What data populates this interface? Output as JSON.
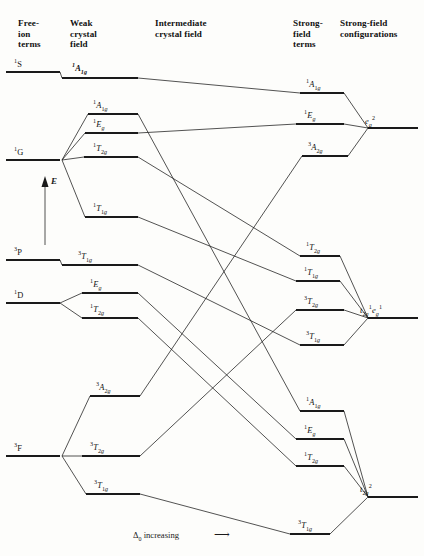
{
  "figure": {
    "title_columns": [
      {
        "id": "free-ion-terms",
        "text": "Free-\nion\nterms",
        "x": 18,
        "y": 18
      },
      {
        "id": "weak-crystal-field",
        "text": "Weak\ncrystal\nfield",
        "x": 70,
        "y": 18
      },
      {
        "id": "intermediate-crystal-field",
        "text": "Intermediate\ncrystal field",
        "x": 155,
        "y": 18
      },
      {
        "id": "strong-field-terms",
        "text": "Strong-\nfield\nterms",
        "x": 293,
        "y": 18
      },
      {
        "id": "strong-field-configurations",
        "text": "Strong-field\nconfigurations",
        "x": 340,
        "y": 18
      }
    ],
    "y_axis_label": "E",
    "x_axis_label": "Δ₀ increasing",
    "x_axis_arrow": "⟶"
  },
  "free_ion_terms": [
    {
      "name": "1S",
      "label_html": "<sup>1</sup>S",
      "y": 72,
      "x1": 6,
      "x2": 60,
      "label_x": 14,
      "label_y": 60
    },
    {
      "name": "1G",
      "label_html": "<sup>1</sup>G",
      "y": 160,
      "x1": 6,
      "x2": 60,
      "label_x": 14,
      "label_y": 148
    },
    {
      "name": "3P",
      "label_html": "<sup>3</sup>P",
      "y": 260,
      "x1": 6,
      "x2": 60,
      "label_x": 14,
      "label_y": 248
    },
    {
      "name": "1D",
      "label_html": "<sup>1</sup>D",
      "y": 303,
      "x1": 6,
      "x2": 60,
      "label_x": 14,
      "label_y": 291
    },
    {
      "name": "3F",
      "label_html": "<sup>3</sup>F",
      "y": 456,
      "x1": 6,
      "x2": 60,
      "label_x": 14,
      "label_y": 444
    }
  ],
  "weak_field_terms": [
    {
      "name": "1A1g-from-1S",
      "label_html": "<i><sup>1</sup>A<sub>1g</sub></i>",
      "bold": true,
      "y": 78,
      "x1": 62,
      "x2": 138,
      "label_x": 72,
      "label_y": 64,
      "parent": "1S"
    },
    {
      "name": "1A1g-from-1G",
      "label_html": "<sup>1</sup><i>A</i><sub>1<i>g</i></sub>",
      "y": 114,
      "x1": 88,
      "x2": 138,
      "label_x": 93,
      "label_y": 101,
      "parent": "1G"
    },
    {
      "name": "1Eg-from-1G",
      "label_html": "<sup>1</sup><i>E</i><sub><i>g</i></sub>",
      "y": 133,
      "x1": 85,
      "x2": 138,
      "label_x": 93,
      "label_y": 120,
      "parent": "1G"
    },
    {
      "name": "1T2g-from-1G",
      "label_html": "<sup>1</sup><i>T</i><sub>2<i>g</i></sub>",
      "y": 157,
      "x1": 84,
      "x2": 138,
      "label_x": 93,
      "label_y": 144,
      "parent": "1G"
    },
    {
      "name": "1T1g-from-1G",
      "label_html": "<sup>1</sup><i>T</i><sub>1<i>g</i></sub>",
      "y": 217,
      "x1": 85,
      "x2": 138,
      "label_x": 93,
      "label_y": 204,
      "parent": "1G"
    },
    {
      "name": "3T1g-from-3P",
      "label_html": "<sup>3</sup><i>T</i><sub>1<i>g</i></sub>",
      "y": 265,
      "x1": 62,
      "x2": 138,
      "label_x": 78,
      "label_y": 252,
      "parent": "3P"
    },
    {
      "name": "1Eg-from-1D",
      "label_html": "<sup>1</sup><i>E</i><sub><i>g</i></sub>",
      "y": 293,
      "x1": 82,
      "x2": 138,
      "label_x": 90,
      "label_y": 280,
      "parent": "1D"
    },
    {
      "name": "1T2g-from-1D",
      "label_html": "<sup>1</sup><i>T</i><sub>2<i>g</i></sub>",
      "y": 318,
      "x1": 82,
      "x2": 138,
      "label_x": 90,
      "label_y": 305,
      "parent": "1D"
    },
    {
      "name": "3A2g-from-3F",
      "label_html": "<sup>3</sup><i>A</i><sub>2<i>g</i></sub>",
      "y": 396,
      "x1": 90,
      "x2": 140,
      "label_x": 96,
      "label_y": 383,
      "parent": "3F"
    },
    {
      "name": "3T2g-from-3F",
      "label_html": "<sup>3</sup><i>T</i><sub>2<i>g</i></sub>",
      "y": 456,
      "x1": 82,
      "x2": 140,
      "label_x": 90,
      "label_y": 443,
      "parent": "3F"
    },
    {
      "name": "3T1g-from-3F",
      "label_html": "<sup>3</sup><i>T</i><sub>1<i>g</i></sub>",
      "y": 494,
      "x1": 86,
      "x2": 140,
      "label_x": 94,
      "label_y": 481,
      "parent": "3F"
    }
  ],
  "strong_field_terms": [
    {
      "name": "1A1g-strong",
      "label_html": "<sup>1</sup><i>A</i><sub>1<i>g</i></sub>",
      "y": 93,
      "x1": 300,
      "x2": 344,
      "label_x": 306,
      "label_y": 80,
      "group": "eg2"
    },
    {
      "name": "1Eg-strong",
      "label_html": "<sup>1</sup><i>E</i><sub><i>g</i></sub>",
      "y": 124,
      "x1": 296,
      "x2": 344,
      "label_x": 304,
      "label_y": 111,
      "group": "eg2"
    },
    {
      "name": "3A2g-strong",
      "label_html": "<sup>3</sup><i>A</i><sub>2<i>g</i></sub>",
      "y": 156,
      "x1": 302,
      "x2": 348,
      "label_x": 308,
      "label_y": 143,
      "group": "eg2"
    },
    {
      "name": "1T2g-strong",
      "label_html": "<sup>1</sup><i>T</i><sub>2<i>g</i></sub>",
      "y": 256,
      "x1": 300,
      "x2": 340,
      "label_x": 306,
      "label_y": 243,
      "group": "t2g1eg1"
    },
    {
      "name": "1T1g-strong",
      "label_html": "<sup>1</sup><i>T</i><sub>1<i>g</i></sub>",
      "y": 281,
      "x1": 296,
      "x2": 340,
      "label_x": 304,
      "label_y": 268,
      "group": "t2g1eg1"
    },
    {
      "name": "3T2g-strong",
      "label_html": "<sup>3</sup><i>T</i><sub>2<i>g</i></sub>",
      "y": 310,
      "x1": 296,
      "x2": 344,
      "label_x": 304,
      "label_y": 297,
      "group": "t2g1eg1"
    },
    {
      "name": "3T1g-strong-mid",
      "label_html": "<sup>3</sup><i>T</i><sub>1<i>g</i></sub>",
      "y": 345,
      "x1": 300,
      "x2": 344,
      "label_x": 306,
      "label_y": 332,
      "group": "t2g1eg1"
    },
    {
      "name": "1A1g-strong-low",
      "label_html": "<sup>1</sup><i>A</i><sub>1<i>g</i></sub>",
      "y": 411,
      "x1": 300,
      "x2": 344,
      "label_x": 306,
      "label_y": 398,
      "group": "t2g2"
    },
    {
      "name": "1Eg-strong-low",
      "label_html": "<sup>1</sup><i>E</i><sub><i>g</i></sub>",
      "y": 439,
      "x1": 296,
      "x2": 344,
      "label_x": 304,
      "label_y": 426,
      "group": "t2g2"
    },
    {
      "name": "1T2g-strong-low",
      "label_html": "<sup>1</sup><i>T</i><sub>2<i>g</i></sub>",
      "y": 466,
      "x1": 296,
      "x2": 344,
      "label_x": 304,
      "label_y": 453,
      "group": "t2g2"
    },
    {
      "name": "3T1g-strong-low",
      "label_html": "<sup>3</sup><i>T</i><sub>1<i>g</i></sub>",
      "y": 534,
      "x1": 290,
      "x2": 330,
      "label_x": 298,
      "label_y": 521,
      "group": "t2g2"
    }
  ],
  "strong_field_configurations": [
    {
      "name": "eg2",
      "label_html": "<i>e</i><sub><i>g</i></sub><sup>2</sup>",
      "y": 128,
      "x1": 368,
      "x2": 418,
      "label_x": 365,
      "label_y": 117,
      "node_x": 368
    },
    {
      "name": "t2g1eg1",
      "label_html": "<i>t</i><sub>2<i>g</i></sub><sup>1</sup><i>e</i><sub><i>g</i></sub><sup>1</sup>",
      "y": 318,
      "x1": 368,
      "x2": 418,
      "label_x": 360,
      "label_y": 306,
      "node_x": 368
    },
    {
      "name": "t2g2",
      "label_html": "<i>t</i><sub>2<i>g</i></sub><sup>2</sup>",
      "y": 497,
      "x1": 368,
      "x2": 418,
      "label_x": 360,
      "label_y": 485,
      "node_x": 368
    }
  ],
  "correlation_lines": [
    {
      "from": "1A1g-from-1S",
      "to": "1A1g-strong"
    },
    {
      "from": "1A1g-from-1G",
      "to": "1A1g-strong-low"
    },
    {
      "from": "1Eg-from-1G",
      "to": "1Eg-strong"
    },
    {
      "from": "1T2g-from-1G",
      "to": "1T2g-strong"
    },
    {
      "from": "1T1g-from-1G",
      "to": "1T1g-strong"
    },
    {
      "from": "3T1g-from-3P",
      "to": "3T1g-strong-mid"
    },
    {
      "from": "1Eg-from-1D",
      "to": "1Eg-strong-low"
    },
    {
      "from": "1T2g-from-1D",
      "to": "1T2g-strong-low"
    },
    {
      "from": "3A2g-from-3F",
      "to": "3A2g-strong"
    },
    {
      "from": "3T2g-from-3F",
      "to": "3T2g-strong"
    },
    {
      "from": "3T1g-from-3F",
      "to": "3T1g-strong-low"
    }
  ],
  "style": {
    "line_color": "#1a1a1a",
    "level_width": 1.9,
    "link_width": 0.75,
    "background": "#fdfdfb"
  }
}
